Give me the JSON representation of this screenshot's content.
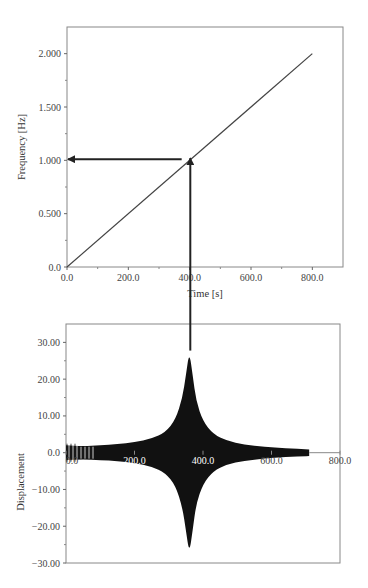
{
  "chart_data": [
    {
      "type": "line",
      "title": "",
      "xlabel": "Time [s]",
      "ylabel": "Frequency [Hz]",
      "xlim": [
        0,
        900
      ],
      "ylim": [
        0,
        2.25
      ],
      "xticks": [
        0,
        200,
        400,
        600,
        800
      ],
      "xtick_labels": [
        "0.0",
        "200.0",
        "400.0",
        "600.0",
        "800.0"
      ],
      "yticks": [
        0,
        0.5,
        1.0,
        1.5,
        2.0
      ],
      "ytick_labels": [
        "0.0",
        "0.500",
        "1.000",
        "1.500",
        "2.000"
      ],
      "grid": false,
      "series": [
        {
          "name": "Frequency sweep",
          "x": [
            0,
            800
          ],
          "y": [
            0,
            2.0
          ]
        }
      ],
      "annotations": [
        {
          "type": "arrow",
          "from": [
            400,
            1.03
          ],
          "to": [
            0,
            1.03
          ],
          "note": "horizontal arrow to frequency ~1.0 Hz"
        }
      ]
    },
    {
      "type": "area",
      "title": "",
      "xlabel": "",
      "ylabel": "Displacement",
      "xlim": [
        0,
        800
      ],
      "ylim": [
        -30,
        35
      ],
      "xticks": [
        0,
        200,
        400,
        600,
        800
      ],
      "xtick_labels": [
        "0.0",
        "200.0",
        "400.0",
        "600.0",
        "800.0"
      ],
      "yticks": [
        -30,
        -20,
        -10,
        0,
        10,
        20,
        30
      ],
      "ytick_labels": [
        "-30.00",
        "-20.00",
        "-10.00",
        "0.0",
        "10.00",
        "20.00",
        "30.00"
      ],
      "grid": false,
      "series": [
        {
          "name": "Displacement envelope",
          "x": [
            0,
            50,
            100,
            150,
            200,
            250,
            290,
            320,
            340,
            350,
            360,
            370,
            380,
            400,
            430,
            470,
            520,
            580,
            640,
            710
          ],
          "y_upper": [
            2.0,
            1.8,
            2.0,
            2.3,
            2.8,
            3.8,
            5.5,
            9.0,
            15.0,
            21.0,
            27.5,
            21.0,
            14.0,
            8.5,
            5.0,
            3.2,
            2.2,
            1.6,
            1.2,
            0.9
          ],
          "y_lower": [
            -2.0,
            -1.8,
            -2.0,
            -2.3,
            -2.8,
            -3.8,
            -5.5,
            -9.0,
            -15.0,
            -21.0,
            -27.5,
            -21.0,
            -14.0,
            -8.5,
            -5.0,
            -3.2,
            -2.2,
            -1.6,
            -1.2,
            -0.9
          ]
        }
      ],
      "annotations": [
        {
          "type": "line",
          "x": 360,
          "note": "vertical line from resonance peak up to frequency plot (arrow at ~400 s, ~1.0 Hz)"
        }
      ],
      "peak": {
        "x": 360,
        "y": 27.5
      }
    }
  ]
}
